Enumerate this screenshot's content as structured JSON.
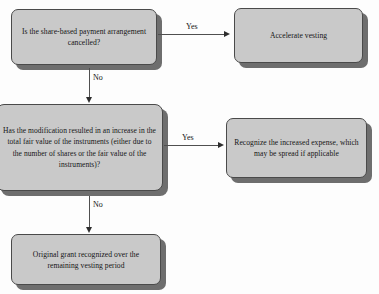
{
  "diagram": {
    "theme": {
      "node_fill": "#c9c9c9",
      "node_border": "#4a4a4a",
      "node_shadow": "#6e6e6e",
      "connector": "#4f4f4f",
      "text": "#151515",
      "background": "#fdfdfd"
    },
    "nodes": [
      {
        "id": "cancel",
        "type": "decision",
        "text": "Is the share-based payment arrangement cancelled?"
      },
      {
        "id": "accelerate",
        "type": "outcome",
        "text": "Accelerate vesting"
      },
      {
        "id": "modification",
        "type": "decision",
        "text": "Has the modification resulted in an increase in the total fair value of the instruments (either due to the number of shares or the fair value of the instruments)?"
      },
      {
        "id": "recognize",
        "type": "outcome",
        "text": "Recognize the increased expense, which may be spread if applicable"
      },
      {
        "id": "original",
        "type": "outcome",
        "text": "Original grant recognized over the remaining vesting period"
      }
    ],
    "edges": [
      {
        "id": "yes1",
        "from": "cancel",
        "to": "accelerate",
        "label": "Yes",
        "direction": "right"
      },
      {
        "id": "no1",
        "from": "cancel",
        "to": "modification",
        "label": "No",
        "direction": "down"
      },
      {
        "id": "yes2",
        "from": "modification",
        "to": "recognize",
        "label": "Yes",
        "direction": "right"
      },
      {
        "id": "no2",
        "from": "modification",
        "to": "original",
        "label": "No",
        "direction": "down"
      }
    ]
  }
}
